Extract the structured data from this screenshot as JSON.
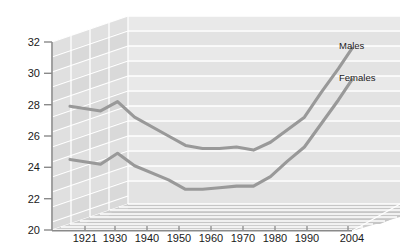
{
  "chart_data": {
    "type": "line",
    "title": "",
    "subtitle": "",
    "xlabel": "",
    "ylabel": "",
    "grid": true,
    "legend_position": "inline-right",
    "style": "3d-perspective-wall",
    "x_tick_labels": [
      "1921",
      "1930",
      "1940",
      "1950",
      "1960",
      "1970",
      "1980",
      "1990",
      "2004"
    ],
    "y_tick_labels": [
      "20",
      "22",
      "24",
      "26",
      "28",
      "30",
      "32"
    ],
    "ylim": [
      20,
      32
    ],
    "y_tick_step": 2,
    "series": [
      {
        "name": "Males",
        "color": "#999999",
        "x": [
          "1921",
          "1930",
          "1935",
          "1940",
          "1950",
          "1955",
          "1960",
          "1965",
          "1970",
          "1975",
          "1980",
          "1985",
          "1990",
          "1995",
          "2000",
          "2004"
        ],
        "values": [
          27.9,
          27.6,
          28.2,
          27.2,
          26.0,
          25.4,
          25.2,
          25.2,
          25.3,
          25.1,
          25.6,
          26.4,
          27.2,
          28.8,
          30.3,
          31.6
        ]
      },
      {
        "name": "Females",
        "color": "#999999",
        "x": [
          "1921",
          "1930",
          "1935",
          "1940",
          "1950",
          "1955",
          "1960",
          "1965",
          "1970",
          "1975",
          "1980",
          "1985",
          "1990",
          "1995",
          "2000",
          "2004"
        ],
        "values": [
          24.5,
          24.2,
          24.9,
          24.1,
          23.2,
          22.6,
          22.6,
          22.7,
          22.8,
          22.8,
          23.4,
          24.4,
          25.3,
          26.8,
          28.3,
          29.6
        ]
      }
    ],
    "annotations": [
      {
        "text": "Males",
        "anchor_value": 31.2
      },
      {
        "text": "Females",
        "anchor_value": 29.2
      }
    ]
  },
  "colors": {
    "line": "#999999",
    "back_wall": "#e2e2e2",
    "back_wall_band": "#ebebeb",
    "side_wall": "#d6d6d6",
    "side_wall_band": "#dedede",
    "floor": "#cfcfcf",
    "floor_band": "#c4c4c4",
    "grid_line": "#ffffff",
    "axis": "#8a8a8a",
    "text": "#1a1a1a"
  }
}
